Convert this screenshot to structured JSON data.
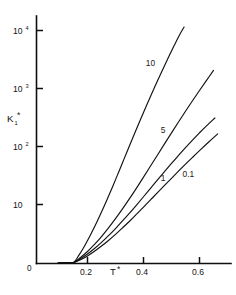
{
  "chart_data": {
    "type": "line",
    "title": "",
    "subtitle": "",
    "xlabel": "T*",
    "ylabel": "K₁*",
    "yscale": "log",
    "xscale": "linear",
    "xlim": [
      0.0,
      0.68
    ],
    "ylim": [
      1.0,
      20000.0
    ],
    "grid": false,
    "legend_position": "inline-curve-labels",
    "x_ticks": [
      {
        "value": 0.2,
        "label": "0.2"
      },
      {
        "value": 0.4,
        "label": "0.4"
      },
      {
        "value": 0.6,
        "label": "0.6"
      }
    ],
    "y_ticks": [
      {
        "value": 10,
        "mantissa": "10",
        "exponent": ""
      },
      {
        "value": 100,
        "mantissa": "10",
        "exponent": "2"
      },
      {
        "value": 1000,
        "mantissa": "10",
        "exponent": "3"
      },
      {
        "value": 10000,
        "mantissa": "10",
        "exponent": "4"
      }
    ],
    "origin_label": "0",
    "series": [
      {
        "name": "10",
        "label": "10",
        "label_x": 0.425,
        "label_y": 2400,
        "x": [
          0.15,
          0.17,
          0.19,
          0.21,
          0.23,
          0.25,
          0.27,
          0.29,
          0.31,
          0.33,
          0.35,
          0.37,
          0.39,
          0.41,
          0.43,
          0.45,
          0.47,
          0.49,
          0.51,
          0.53,
          0.545
        ],
        "y": [
          1.0,
          1.35,
          1.95,
          2.95,
          4.6,
          7.4,
          12.2,
          20.5,
          35.0,
          60.0,
          103.0,
          176.0,
          298.0,
          500.0,
          830.0,
          1360.0,
          2200.0,
          3520.0,
          5550.0,
          8600.0,
          11500.0
        ]
      },
      {
        "name": "5",
        "label": "5",
        "label_x": 0.47,
        "label_y": 170,
        "x": [
          0.15,
          0.175,
          0.2,
          0.225,
          0.25,
          0.275,
          0.3,
          0.325,
          0.35,
          0.375,
          0.4,
          0.425,
          0.45,
          0.475,
          0.5,
          0.525,
          0.55,
          0.575,
          0.6,
          0.625,
          0.65
        ],
        "y": [
          1.0,
          1.22,
          1.55,
          2.05,
          2.8,
          3.95,
          5.7,
          8.4,
          12.6,
          19.2,
          29.6,
          46.0,
          71.5,
          111.0,
          172.0,
          265.0,
          405.0,
          615.0,
          925.0,
          1380.0,
          2050.0
        ]
      },
      {
        "name": "1",
        "label": "1",
        "label_x": 0.47,
        "label_y": 25,
        "x": [
          0.15,
          0.175,
          0.2,
          0.225,
          0.25,
          0.275,
          0.3,
          0.325,
          0.35,
          0.375,
          0.4,
          0.425,
          0.45,
          0.475,
          0.5,
          0.525,
          0.55,
          0.575,
          0.6,
          0.625,
          0.655
        ],
        "y": [
          1.0,
          1.16,
          1.4,
          1.74,
          2.22,
          2.9,
          3.85,
          5.2,
          7.1,
          9.8,
          13.6,
          19.0,
          26.5,
          36.8,
          51.0,
          70.0,
          95.5,
          129.0,
          172.0,
          227.0,
          310.0
        ]
      },
      {
        "name": "0.1",
        "label": "0.1",
        "label_x": 0.56,
        "label_y": 30,
        "x": [
          0.15,
          0.175,
          0.2,
          0.225,
          0.25,
          0.275,
          0.3,
          0.325,
          0.35,
          0.375,
          0.4,
          0.425,
          0.45,
          0.475,
          0.5,
          0.525,
          0.55,
          0.575,
          0.6,
          0.63,
          0.665
        ],
        "y": [
          1.0,
          1.12,
          1.3,
          1.56,
          1.92,
          2.4,
          3.05,
          3.95,
          5.15,
          6.8,
          9.0,
          12.0,
          16.0,
          21.3,
          28.3,
          37.5,
          49.5,
          65.0,
          85.0,
          116.0,
          165.0
        ]
      }
    ]
  },
  "axes": {
    "y_label_base": "K",
    "y_label_sub": "1",
    "y_label_star": "*",
    "x_label_base": "T",
    "x_label_star": "*"
  }
}
